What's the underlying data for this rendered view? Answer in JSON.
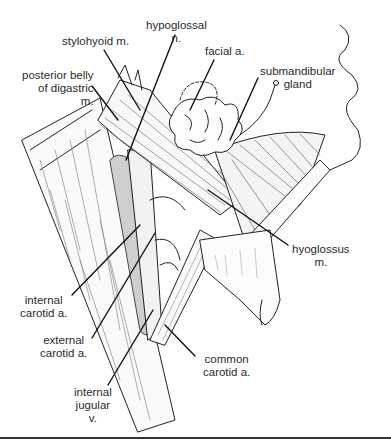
{
  "figure": {
    "labels": [
      {
        "id": "stylohyoid",
        "text": "stylohyoid m.",
        "x": 62,
        "y": 35
      },
      {
        "id": "hypoglossal",
        "text": "hypoglossal\nn.",
        "x": 146,
        "y": 19
      },
      {
        "id": "facial-artery",
        "text": "facial a.",
        "x": 205,
        "y": 45
      },
      {
        "id": "posterior-belly-digastric",
        "text": "posterior belly\nof digastric\nm.",
        "x": 22,
        "y": 69
      },
      {
        "id": "submandibular-gland",
        "text": "submandibular\ngland",
        "x": 260,
        "y": 65
      },
      {
        "id": "hyoglossus",
        "text": "hyoglossus\nm.",
        "x": 292,
        "y": 243
      },
      {
        "id": "internal-carotid",
        "text": "internal\ncarotid a.",
        "x": 20,
        "y": 294
      },
      {
        "id": "external-carotid",
        "text": "external\ncarotid a.",
        "x": 40,
        "y": 334
      },
      {
        "id": "common-carotid",
        "text": "common\ncarotid a.",
        "x": 203,
        "y": 353
      },
      {
        "id": "internal-jugular",
        "text": "internal\njugular\nv.",
        "x": 74,
        "y": 386
      }
    ]
  },
  "colors": {
    "ink": "#222222",
    "background": "#ffffff",
    "stipple": "#555555"
  }
}
